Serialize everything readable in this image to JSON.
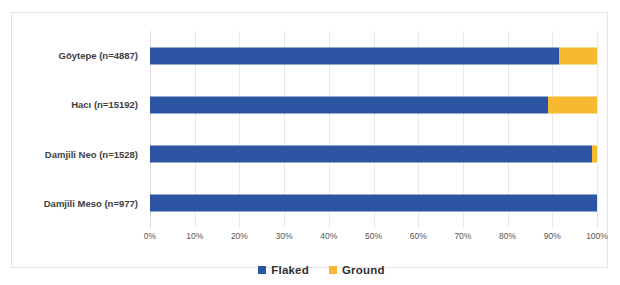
{
  "chart_data": {
    "type": "bar",
    "orientation": "horizontal",
    "stacked": true,
    "normalized": true,
    "title": "",
    "subtitle": "",
    "xlabel": "",
    "ylabel": "",
    "xlim": [
      0,
      100
    ],
    "xtick_labels": [
      "0%",
      "10%",
      "20%",
      "30%",
      "40%",
      "50%",
      "60%",
      "70%",
      "80%",
      "90%",
      "100%"
    ],
    "xticks": [
      0,
      10,
      20,
      30,
      40,
      50,
      60,
      70,
      80,
      90,
      100
    ],
    "grid": true,
    "grid_axis": "x",
    "legend_position": "bottom",
    "categories": [
      "Göytepe (n=4887)",
      "Hacı (n=15192)",
      "Damjili Neo (n=1528)",
      "Damjili Meso (n=977)"
    ],
    "series": [
      {
        "name": "Flaked",
        "color": "#2B55A2",
        "values": [
          91.5,
          89.0,
          98.9,
          100.0
        ]
      },
      {
        "name": "Ground",
        "color": "#F6B92F",
        "values": [
          8.5,
          11.0,
          1.1,
          0.0
        ]
      }
    ]
  },
  "legend": {
    "items": [
      {
        "label": "Flaked",
        "color": "#2B55A2"
      },
      {
        "label": "Ground",
        "color": "#F6B92F"
      }
    ]
  },
  "caption": {
    "text": ""
  },
  "colors": {
    "flaked": "#2B55A2",
    "ground": "#F6B92F",
    "gridline": "#e8e8e8",
    "frame": "#e3e3e3",
    "label_text": "#404040",
    "tick_text": "#555555"
  }
}
